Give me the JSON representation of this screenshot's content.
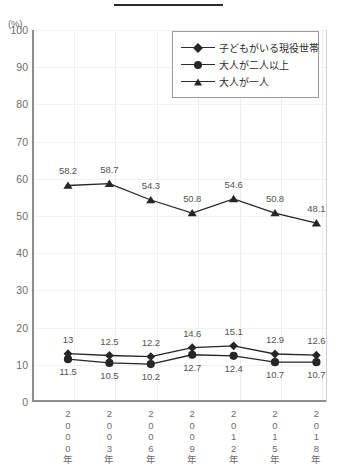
{
  "axis_unit_label": "(%)",
  "decoration": {
    "top_rule": "—"
  },
  "legend": {
    "position": "top-right",
    "entries": [
      {
        "label": "子どもがいる現役世帯",
        "marker": "diamond-marker-icon"
      },
      {
        "label": "大人が二人以上",
        "marker": "circle-marker-icon"
      },
      {
        "label": "大人が一人",
        "marker": "triangle-marker-icon"
      }
    ]
  },
  "chart_data": {
    "type": "line",
    "title": "",
    "subtitle": "",
    "xlabel": "",
    "ylabel": "(%)",
    "grid": true,
    "legend_position": "top-right",
    "categories": [
      "2000年",
      "2003年",
      "2006年",
      "2009年",
      "2012年",
      "2015年",
      "2018年"
    ],
    "category_chars": [
      [
        "2",
        "0",
        "0",
        "0",
        "年"
      ],
      [
        "2",
        "0",
        "0",
        "3",
        "年"
      ],
      [
        "2",
        "0",
        "0",
        "6",
        "年"
      ],
      [
        "2",
        "0",
        "0",
        "9",
        "年"
      ],
      [
        "2",
        "0",
        "1",
        "2",
        "年"
      ],
      [
        "2",
        "0",
        "1",
        "5",
        "年"
      ],
      [
        "2",
        "0",
        "1",
        "8",
        "年"
      ]
    ],
    "ylim": [
      0,
      100
    ],
    "yticks": [
      100,
      90,
      80,
      70,
      60,
      50,
      40,
      30,
      20,
      10,
      0
    ],
    "ytick_labels": [
      "100",
      "90",
      "80",
      "70",
      "60",
      "50",
      "40",
      "30",
      "20",
      "10",
      "0"
    ],
    "series": [
      {
        "name": "子どもがいる現役世帯",
        "marker": "diamond",
        "values": [
          13,
          12.5,
          12.2,
          14.6,
          15.1,
          12.9,
          12.6
        ],
        "labels": [
          "13",
          "12.5",
          "12.2",
          "14.6",
          "15.1",
          "12.9",
          "12.6"
        ],
        "label_side": "above",
        "color": "#262626"
      },
      {
        "name": "大人が二人以上",
        "marker": "circle",
        "values": [
          11.5,
          10.5,
          10.2,
          12.7,
          12.4,
          10.7,
          10.7
        ],
        "labels": [
          "11.5",
          "10.5",
          "10.2",
          "12.7",
          "12.4",
          "10.7",
          "10.7"
        ],
        "label_side": "below",
        "color": "#262626"
      },
      {
        "name": "大人が一人",
        "marker": "triangle",
        "values": [
          58.2,
          58.7,
          54.3,
          50.8,
          54.6,
          50.8,
          48.1
        ],
        "labels": [
          "58.2",
          "58.7",
          "54.3",
          "50.8",
          "54.6",
          "50.8",
          "48.1"
        ],
        "label_side": "above",
        "color": "#262626"
      }
    ]
  },
  "colors": {
    "series": "#262626",
    "axis": "#8d8d8d",
    "grid": "#f0f0f0",
    "label_text": "#6b6b6b"
  }
}
